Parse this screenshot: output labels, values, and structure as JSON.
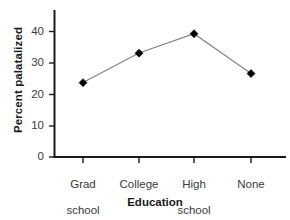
{
  "chart_data": {
    "type": "line",
    "title": "",
    "xlabel": "Education",
    "ylabel": "Percent palatalized",
    "categories": [
      "Grad school",
      "College",
      "High school",
      "None"
    ],
    "category_lines": [
      [
        "Grad",
        "school"
      ],
      [
        "College"
      ],
      [
        "High",
        "school"
      ],
      [
        "None"
      ]
    ],
    "values": [
      23.7,
      33.1,
      39.3,
      26.6
    ],
    "ylim": [
      0,
      45
    ],
    "yticks": [
      0,
      10,
      20,
      30,
      40
    ],
    "ytick_labels": [
      "0",
      "10",
      "20",
      "30",
      "40"
    ],
    "grid": false,
    "legend": false,
    "marker": "diamond",
    "marker_color": "#000000",
    "line_color": "#808080",
    "axis_color": "#1a1a1a"
  },
  "axes": {
    "ytick_0": "0",
    "ytick_10": "10",
    "ytick_20": "20",
    "ytick_30": "30",
    "ytick_40": "40",
    "xtick_1_line1": "Grad",
    "xtick_1_line2": "school",
    "xtick_2_line1": "College",
    "xtick_2_line2": "",
    "xtick_3_line1": "High",
    "xtick_3_line2": "school",
    "xtick_4_line1": "None",
    "xtick_4_line2": "",
    "xaxis_title": "Education",
    "yaxis_title": "Percent palatalized"
  }
}
